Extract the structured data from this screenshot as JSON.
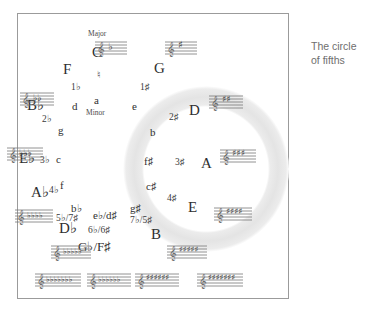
{
  "caption": {
    "line1": "The circle circle",
    "text": "The circle\nof fifths",
    "l1": "The circle",
    "l2": "of fifths"
  },
  "labels": {
    "major_header": "Major",
    "minor_header": "Minor"
  },
  "wheel": {
    "description": "Circle of fifths wheel with major keys outside the ring, relative minor keys inside, and key-signature accidental counts on the ring.",
    "positions": [
      {
        "major": "C",
        "minor": "a",
        "accidentals": "♮",
        "clock": 12
      },
      {
        "major": "G",
        "minor": "e",
        "accidentals": "1♯",
        "clock": 1
      },
      {
        "major": "D",
        "minor": "b",
        "accidentals": "2♯",
        "clock": 2
      },
      {
        "major": "A",
        "minor": "f♯",
        "accidentals": "3♯",
        "clock": 3
      },
      {
        "major": "E",
        "minor": "c♯",
        "accidentals": "4♯",
        "clock": 4
      },
      {
        "major": "B",
        "minor": "g♯",
        "accidentals": "7♭/5♯",
        "clock": 5
      },
      {
        "major": "G♭/F♯",
        "minor": "e♭/d♯",
        "accidentals": "6♭/6♯",
        "clock": 6
      },
      {
        "major": "D♭",
        "minor": "b♭",
        "accidentals": "5♭/7♯",
        "clock": 7
      },
      {
        "major": "A♭",
        "minor": "f",
        "accidentals": "4♭",
        "clock": 8
      },
      {
        "major": "E♭",
        "minor": "c",
        "accidentals": "3♭",
        "clock": 9
      },
      {
        "major": "B♭",
        "minor": "g",
        "accidentals": "2♭",
        "clock": 10
      },
      {
        "major": "F",
        "minor": "d",
        "accidentals": "1♭",
        "clock": 11
      }
    ]
  },
  "staves": [
    {
      "key": "F",
      "signature": "1 flat",
      "clock": 11
    },
    {
      "key": "C",
      "signature": "none",
      "clock": 12
    },
    {
      "key": "G",
      "signature": "1 sharp",
      "clock": 1
    },
    {
      "key": "B♭",
      "signature": "2 flats",
      "clock": 10
    },
    {
      "key": "D",
      "signature": "2 sharps",
      "clock": 2
    },
    {
      "key": "E♭",
      "signature": "3 flats",
      "clock": 9
    },
    {
      "key": "A",
      "signature": "3 sharps",
      "clock": 3
    },
    {
      "key": "A♭",
      "signature": "4 flats",
      "clock": 8
    },
    {
      "key": "E",
      "signature": "4 sharps",
      "clock": 4
    },
    {
      "key": "D♭",
      "signature": "5 flats",
      "clock": 7
    },
    {
      "key": "B",
      "signature": "5 sharps",
      "clock": 5
    },
    {
      "key": "G♭",
      "signature": "6 flats",
      "clock": 6
    },
    {
      "key": "F♯",
      "signature": "6 sharps",
      "clock": 6
    },
    {
      "key": "C♭",
      "signature": "7 flats",
      "clock": 7
    },
    {
      "key": "C♯",
      "signature": "7 sharps",
      "clock": 5
    }
  ],
  "colors": {
    "ring": "#e8e8e8",
    "frame_border": "#9b9b9b",
    "text": "#2f2f2f",
    "caption": "#6e6e6e",
    "staff": "#707070",
    "background": "#ffffff"
  }
}
